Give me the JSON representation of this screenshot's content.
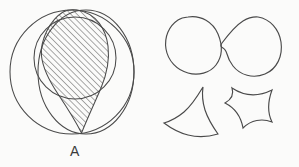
{
  "figure": {
    "background_color": "#fbfbfa",
    "ink_color": "#4a4a4a",
    "line_width": 1.0
  },
  "panel_a": {
    "label": "A",
    "description": "sphere-with-intersecting-circles-and-hatched-lens",
    "elements": {
      "outer_circle": {
        "name": "outer-circle",
        "cx": 72,
        "cy": 72,
        "r": 62
      },
      "offset_circle": {
        "name": "offset-circle",
        "cx": 85,
        "cy": 72,
        "rx": 49,
        "ry": 62
      },
      "inner_ellipse": {
        "name": "inner-ellipse",
        "cx": 75,
        "cy": 58,
        "rx": 40,
        "ry": 40
      },
      "hatched_region": {
        "name": "hatched-lens-region",
        "hatch_angle_degrees": 45,
        "hatch_spacing_px": 3.1,
        "hatch_color": "#5a5a5a"
      }
    }
  },
  "panel_b": {
    "label": "B",
    "description": "four-outlined-blob-shapes",
    "shapes": [
      {
        "name": "rounded-blob-top-left",
        "position": "top-left"
      },
      {
        "name": "teardrop-blob-top-right",
        "position": "top-right"
      },
      {
        "name": "concave-fan-shape-bottom-left",
        "position": "bottom-left"
      },
      {
        "name": "four-pointed-astroid-shape-bottom-right",
        "position": "bottom-right"
      }
    ]
  }
}
